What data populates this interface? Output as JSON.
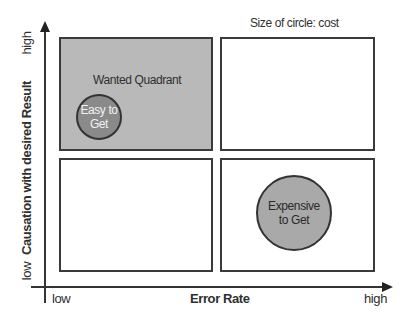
{
  "legend": {
    "size_note": "Size of circle: cost"
  },
  "axes": {
    "x": {
      "label": "Error Rate",
      "low": "low",
      "high": "high"
    },
    "y": {
      "label": "Causation with desired Result",
      "low": "low",
      "high": "high"
    }
  },
  "quadrants": [
    {
      "id": "top-left",
      "label": "Wanted Quadrant",
      "shaded": true
    },
    {
      "id": "top-right",
      "label": "",
      "shaded": false
    },
    {
      "id": "bottom-left",
      "label": "",
      "shaded": false
    },
    {
      "id": "bottom-right",
      "label": "",
      "shaded": false
    }
  ],
  "circles": [
    {
      "line1": "Easy to",
      "line2": "Get",
      "quadrant": "top-left",
      "size": "small"
    },
    {
      "line1": "Expensive",
      "line2": "to Get",
      "quadrant": "bottom-right",
      "size": "large"
    }
  ],
  "colors": {
    "shaded_quadrant": "#b9b9b9",
    "small_circle": "#8a8a8a",
    "large_circle": "#a9a9a9",
    "lines": "#333333"
  }
}
